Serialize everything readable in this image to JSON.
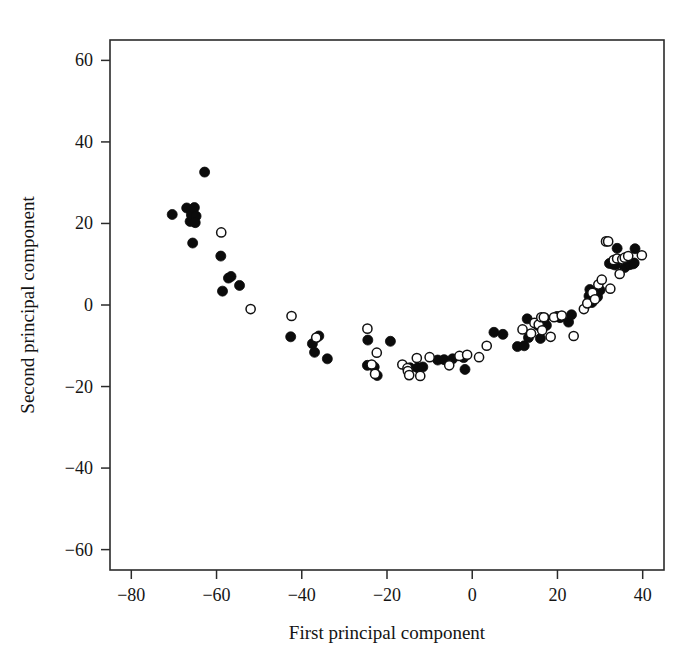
{
  "figure": {
    "background_color": "#ffffff",
    "foreground_color": "#111111"
  },
  "chart_data": {
    "type": "scatter",
    "title": "",
    "xlabel": "First principal component",
    "ylabel": "Second principal component",
    "xlim": [
      -85,
      45
    ],
    "ylim": [
      -65,
      65
    ],
    "xticks": [
      -80,
      -60,
      -40,
      -20,
      0,
      20,
      40
    ],
    "yticks": [
      -60,
      -40,
      -20,
      0,
      20,
      40,
      60
    ],
    "xtick_labels": [
      "−80",
      "−60",
      "−40",
      "−20",
      "0",
      "20",
      "40"
    ],
    "ytick_labels": [
      "−60",
      "−40",
      "−20",
      "0",
      "20",
      "40",
      "60"
    ],
    "grid": false,
    "legend": null,
    "legend_position": "none",
    "marker_size_px": 5.0,
    "series": [
      {
        "name": "filled",
        "marker": "filled-circle",
        "color": "#0b0b0b",
        "points": [
          [
            -70.4,
            22.2
          ],
          [
            -67.0,
            23.8
          ],
          [
            -66.2,
            20.5
          ],
          [
            -65.9,
            22.1
          ],
          [
            -65.2,
            23.9
          ],
          [
            -64.8,
            21.8
          ],
          [
            -65.0,
            20.2
          ],
          [
            -62.8,
            32.6
          ],
          [
            -65.6,
            15.2
          ],
          [
            -59.0,
            12.0
          ],
          [
            -57.2,
            6.6
          ],
          [
            -56.6,
            7.0
          ],
          [
            -58.6,
            3.4
          ],
          [
            -54.6,
            4.8
          ],
          [
            -42.6,
            -7.8
          ],
          [
            -37.5,
            -9.5
          ],
          [
            -36.0,
            -7.6
          ],
          [
            -37.0,
            -11.6
          ],
          [
            -34.0,
            -13.2
          ],
          [
            -24.5,
            -8.6
          ],
          [
            -24.6,
            -14.8
          ],
          [
            -23.0,
            -15.2
          ],
          [
            -22.3,
            -17.3
          ],
          [
            -19.2,
            -8.9
          ],
          [
            -14.6,
            -15.4
          ],
          [
            -12.8,
            -15.4
          ],
          [
            -11.6,
            -15.2
          ],
          [
            -8.1,
            -13.5
          ],
          [
            -6.6,
            -13.4
          ],
          [
            -4.6,
            -13.2
          ],
          [
            -2.0,
            -12.9
          ],
          [
            -1.7,
            -15.8
          ],
          [
            5.1,
            -6.7
          ],
          [
            7.2,
            -7.2
          ],
          [
            10.6,
            -10.2
          ],
          [
            12.2,
            -10.0
          ],
          [
            12.9,
            -3.4
          ],
          [
            13.2,
            -8.0
          ],
          [
            15.4,
            -5.0
          ],
          [
            15.9,
            -4.6
          ],
          [
            16.4,
            -5.2
          ],
          [
            16.8,
            -4.4
          ],
          [
            17.0,
            -3.2
          ],
          [
            17.4,
            -5.0
          ],
          [
            16.0,
            -8.2
          ],
          [
            19.9,
            -2.8
          ],
          [
            20.6,
            -3.1
          ],
          [
            22.6,
            -4.2
          ],
          [
            23.3,
            -2.4
          ],
          [
            27.4,
            2.2
          ],
          [
            27.6,
            3.8
          ],
          [
            28.1,
            0.6
          ],
          [
            29.4,
            2.0
          ],
          [
            30.0,
            3.6
          ],
          [
            32.2,
            10.2
          ],
          [
            33.0,
            10.0
          ],
          [
            33.6,
            9.8
          ],
          [
            34.0,
            13.9
          ],
          [
            35.8,
            9.2
          ],
          [
            36.6,
            10.2
          ],
          [
            37.0,
            9.9
          ],
          [
            37.8,
            10.1
          ],
          [
            38.2,
            13.8
          ],
          [
            38.0,
            10.3
          ]
        ]
      },
      {
        "name": "open",
        "marker": "open-circle",
        "color": "#111111",
        "points": [
          [
            -58.9,
            17.8
          ],
          [
            -52.0,
            -1.0
          ],
          [
            -42.4,
            -2.7
          ],
          [
            -36.6,
            -8.0
          ],
          [
            -24.6,
            -5.8
          ],
          [
            -22.4,
            -11.7
          ],
          [
            -23.6,
            -14.6
          ],
          [
            -22.8,
            -16.9
          ],
          [
            -16.4,
            -14.6
          ],
          [
            -15.2,
            -15.5
          ],
          [
            -15.1,
            -16.2
          ],
          [
            -14.8,
            -17.2
          ],
          [
            -13.0,
            -13.0
          ],
          [
            -12.2,
            -17.4
          ],
          [
            -10.0,
            -12.8
          ],
          [
            -5.4,
            -14.8
          ],
          [
            -3.0,
            -12.5
          ],
          [
            -1.2,
            -12.2
          ],
          [
            1.6,
            -12.8
          ],
          [
            3.4,
            -10.0
          ],
          [
            11.8,
            -6.0
          ],
          [
            13.8,
            -7.0
          ],
          [
            14.6,
            -4.4
          ],
          [
            15.6,
            -4.8
          ],
          [
            16.2,
            -3.0
          ],
          [
            16.8,
            -3.0
          ],
          [
            16.4,
            -6.2
          ],
          [
            18.4,
            -7.8
          ],
          [
            19.2,
            -3.0
          ],
          [
            21.0,
            -2.6
          ],
          [
            23.8,
            -7.6
          ],
          [
            26.2,
            -1.0
          ],
          [
            27.0,
            0.4
          ],
          [
            28.2,
            3.0
          ],
          [
            28.8,
            1.4
          ],
          [
            29.6,
            5.0
          ],
          [
            30.4,
            6.2
          ],
          [
            31.4,
            15.6
          ],
          [
            31.9,
            15.6
          ],
          [
            32.4,
            4.0
          ],
          [
            33.2,
            11.0
          ],
          [
            34.0,
            11.4
          ],
          [
            34.6,
            7.6
          ],
          [
            35.2,
            11.2
          ],
          [
            35.8,
            11.6
          ],
          [
            36.6,
            12.0
          ],
          [
            39.8,
            12.2
          ]
        ]
      }
    ]
  }
}
